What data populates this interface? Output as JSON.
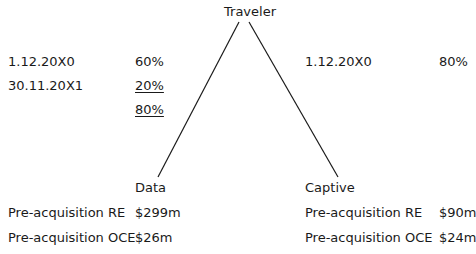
{
  "parent": {
    "name": "Traveler"
  },
  "left_holdings": [
    {
      "date": "1.12.20X0",
      "pct": "60%",
      "underlined": false
    },
    {
      "date": "30.11.20X1",
      "pct": "20%",
      "underlined": true
    },
    {
      "date": "",
      "pct": "80%",
      "underlined": true
    }
  ],
  "right_holdings": [
    {
      "date": "1.12.20X0",
      "pct": "80%"
    }
  ],
  "subsidiaries": [
    {
      "name": "Data",
      "rows": [
        {
          "label": "Pre-acquisition RE",
          "value": "$299m"
        },
        {
          "label": "Pre-acquisition OCE",
          "value": "$26m"
        }
      ]
    },
    {
      "name": "Captive",
      "rows": [
        {
          "label": "Pre-acquisition RE",
          "value": "$90m"
        },
        {
          "label": "Pre-acquisition OCE",
          "value": "$24m"
        }
      ]
    }
  ]
}
